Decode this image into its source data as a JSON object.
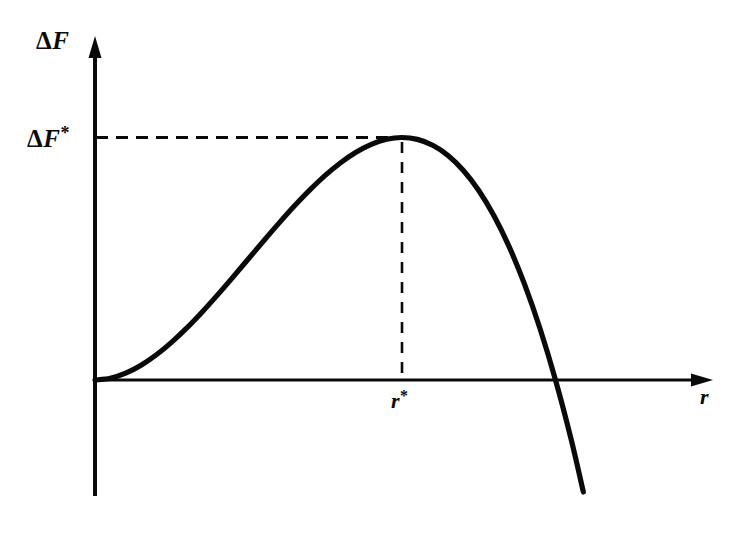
{
  "figure": {
    "background_color": "#ffffff",
    "ink_color": "#0a0a0a",
    "axis_y_label": "ΔF",
    "axis_y_label_delta": "Δ",
    "axis_y_label_symbol": "F",
    "axis_x_label": "r",
    "marker_y_label_delta": "Δ",
    "marker_y_label_symbol": "F",
    "marker_y_label_star": "*",
    "marker_y_label_full": "ΔF*",
    "marker_x_label_symbol": "r",
    "marker_x_label_star": "*",
    "marker_x_label_full": "r*"
  },
  "chart_data": {
    "type": "line",
    "title": "",
    "subtitle": "",
    "xlabel": "r",
    "ylabel": "ΔF",
    "grid": false,
    "legend": false,
    "legend_position": "none",
    "xlim": [
      0,
      2.05
    ],
    "ylim": [
      -1.45,
      1.35
    ],
    "axis_style": "arrow-headed axes, no tick marks, no tick labels",
    "annotations": [
      {
        "name": "critical-free-energy",
        "label": "ΔF*",
        "kind": "horizontal-dashed-guide",
        "value_y": 1.0,
        "from_x": 0.0,
        "to_x": 1.0,
        "note": "dashed line from y-axis to curve maximum"
      },
      {
        "name": "critical-radius",
        "label": "r*",
        "kind": "vertical-dashed-guide",
        "value_x": 1.0,
        "from_y": 0.0,
        "to_y": 1.0,
        "note": "dashed line from x-axis up to curve maximum"
      }
    ],
    "series": [
      {
        "name": "free energy of cluster formation",
        "equation": "dF(r) = 3*r^2 - 2*r^3 (normalized so max = 1 at r = 1)",
        "x": [
          0.0,
          0.05,
          0.1,
          0.15,
          0.2,
          0.25,
          0.3,
          0.35,
          0.4,
          0.45,
          0.5,
          0.55,
          0.6,
          0.65,
          0.7,
          0.75,
          0.8,
          0.85,
          0.9,
          0.95,
          1.0,
          1.05,
          1.1,
          1.15,
          1.2,
          1.25,
          1.3,
          1.35,
          1.4,
          1.45,
          1.5,
          1.55,
          1.6,
          1.65,
          1.7,
          1.75,
          1.8
        ],
        "y": [
          0.0,
          0.0073,
          0.028,
          0.0608,
          0.104,
          0.1563,
          0.216,
          0.2818,
          0.352,
          0.4253,
          0.5,
          0.5748,
          0.648,
          0.7183,
          0.784,
          0.8438,
          0.896,
          0.9393,
          0.972,
          0.9928,
          1.0,
          0.9923,
          0.968,
          0.9258,
          0.864,
          0.7813,
          0.676,
          0.5468,
          0.392,
          0.2103,
          0.0,
          -0.2397,
          -0.512,
          -0.8192,
          -1.1628,
          -1.5453,
          -1.9683
        ],
        "critical_point": {
          "x": 1.0,
          "y": 1.0
        },
        "zero_crossing": {
          "x": 1.5,
          "y": 0.0
        },
        "origin_point": {
          "x": 0.0,
          "y": 0.0
        }
      }
    ]
  }
}
